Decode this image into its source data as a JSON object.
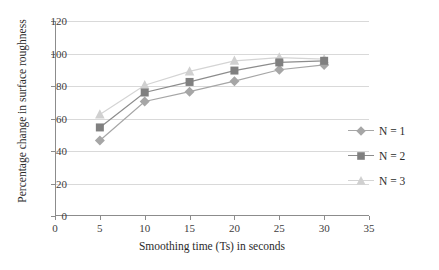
{
  "chart_data": {
    "type": "line",
    "title": "",
    "xlabel": "Smoothing time (Ts) in seconds",
    "ylabel": "Percentage change in surface roughness",
    "x": [
      5,
      10,
      15,
      20,
      25,
      30
    ],
    "xlim": [
      0,
      35
    ],
    "ylim": [
      0,
      120
    ],
    "xticks": [
      0,
      5,
      10,
      15,
      20,
      25,
      30,
      35
    ],
    "yticks": [
      0,
      20,
      40,
      60,
      80,
      100,
      120
    ],
    "grid": "horizontal",
    "legend_position": "right",
    "series": [
      {
        "name": "N = 1",
        "marker": "diamond",
        "color": "#a6a6a6",
        "line_color": "#a6a6a6",
        "values": [
          46.5,
          70.5,
          76.5,
          83.0,
          90.0,
          93.0
        ]
      },
      {
        "name": "N = 2",
        "marker": "square",
        "color": "#808080",
        "line_color": "#8c8c8c",
        "values": [
          54.5,
          76.0,
          82.5,
          89.5,
          94.5,
          95.5
        ]
      },
      {
        "name": "N = 3",
        "marker": "triangle",
        "color": "#d0d0d0",
        "line_color": "#d4d4d4",
        "values": [
          62.5,
          80.5,
          89.0,
          95.5,
          97.5,
          96.5
        ]
      }
    ]
  },
  "axes": {
    "x_tick_labels": [
      "0",
      "5",
      "10",
      "15",
      "20",
      "25",
      "30",
      "35"
    ],
    "y_tick_labels": [
      "0",
      "20",
      "40",
      "60",
      "80",
      "100",
      "120"
    ],
    "x_title": "Smoothing time (Ts) in seconds",
    "y_title": "Percentage change in surface roughness"
  },
  "legend": {
    "items": [
      {
        "label": "N = 1",
        "icon": "diamond-marker-icon"
      },
      {
        "label": "N = 2",
        "icon": "square-marker-icon"
      },
      {
        "label": "N = 3",
        "icon": "triangle-marker-icon"
      }
    ]
  },
  "style": {
    "background": "#ffffff",
    "grid_color": "#d9d9d9",
    "axis_color": "#8c8c8c",
    "text_color": "#2b2b2b"
  }
}
